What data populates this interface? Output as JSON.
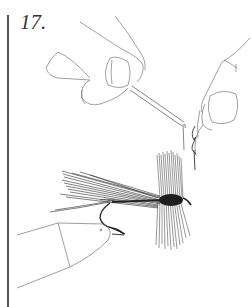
{
  "figure": {
    "step_number": "17.",
    "colors": {
      "line": "#666666",
      "ink": "#222222",
      "rule": "#555555",
      "background": "#ffffff"
    }
  }
}
